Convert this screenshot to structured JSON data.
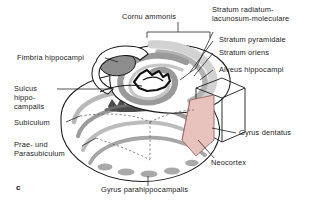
{
  "figure": {
    "panel_letter": "c",
    "background_color": "#ffffff",
    "ink_color": "#1a1a1a",
    "neocortex_fill_color": "#e8c3bd",
    "neocortex_stroke_color": "#9a6a64",
    "band_light_color": "#cfcfcf",
    "band_mid_color": "#a8a8a8",
    "band_dark_color": "#6e6e6e",
    "band_darkest_color": "#3a3a3a"
  },
  "labels": {
    "cornu_ammonis": "Cornu ammonis",
    "stratum_radiatum_line1": "Stratum radiatum-",
    "stratum_radiatum_line2": "lacunosum-moleculare",
    "stratum_pyramidale": "Stratum pyramidale",
    "stratum_oriens": "Stratum oriens",
    "alveus_hippocampi": "Alveus hippocampi",
    "fimbria_hippocampi": "Fimbria hippocampi",
    "sulcus_line1": "Sulcus",
    "sulcus_line2": "hippo-",
    "sulcus_line3": "campalis",
    "subiculum": "Subiculum",
    "prae_und_line1": "Prae- und",
    "prae_und_line2": "Parasubiculum",
    "gyrus_dentatus": "Gyrus dentatus",
    "neocortex": "Neocortex",
    "gyrus_parahippocampalis": "Gyrus parahippocampalis"
  }
}
